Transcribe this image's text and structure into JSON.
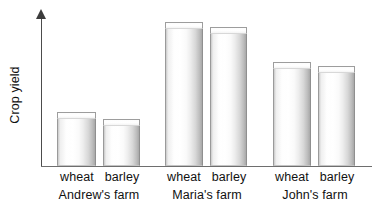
{
  "chart_data": {
    "type": "bar",
    "title": "",
    "subtitle": "",
    "xlabel": "",
    "ylabel": "Crop yield",
    "categories": [
      "Andrew's farm",
      "Maria's farm",
      "John's farm"
    ],
    "subcategories": [
      "wheat",
      "barley"
    ],
    "grid": false,
    "legend_position": "none",
    "y_axis_ticks": [],
    "y_axis_has_arrow": true,
    "y_axis_units": "unlabelled (relative scale)",
    "ylim": [
      0,
      100
    ],
    "series": [
      {
        "name": "wheat",
        "values": [
          37.5,
          100.0,
          72.2
        ]
      },
      {
        "name": "barley",
        "values": [
          32.6,
          96.5,
          69.4
        ]
      }
    ],
    "bars": [
      {
        "group": "Andrew's farm",
        "crop": "wheat",
        "value": 37.5
      },
      {
        "group": "Andrew's farm",
        "crop": "barley",
        "value": 32.6
      },
      {
        "group": "Maria's farm",
        "crop": "wheat",
        "value": 100.0
      },
      {
        "group": "Maria's farm",
        "crop": "barley",
        "value": 96.5
      },
      {
        "group": "John's farm",
        "crop": "wheat",
        "value": 72.2
      },
      {
        "group": "John's farm",
        "crop": "barley",
        "value": 69.4
      }
    ],
    "annotations": []
  },
  "axis": {
    "y_label": "Crop yield"
  },
  "crop_labels": [
    {
      "text": "wheat",
      "left": 57,
      "width": 40
    },
    {
      "text": "barley",
      "left": 102,
      "width": 40
    },
    {
      "text": "wheat",
      "left": 164,
      "width": 40
    },
    {
      "text": "barley",
      "left": 209,
      "width": 40
    },
    {
      "text": "wheat",
      "left": 272,
      "width": 40
    },
    {
      "text": "barley",
      "left": 317,
      "width": 40
    }
  ],
  "group_labels": [
    {
      "text": "Andrew's farm",
      "left": 44,
      "width": 110
    },
    {
      "text": "Maria's farm",
      "left": 152,
      "width": 110
    },
    {
      "text": "John's farm",
      "left": 260,
      "width": 110
    }
  ],
  "bar_geometry": [
    {
      "left": 57,
      "width": 39,
      "height": 54,
      "name": "bar-andrew-wheat"
    },
    {
      "left": 103,
      "width": 37,
      "height": 47,
      "name": "bar-andrew-barley"
    },
    {
      "left": 165,
      "width": 38,
      "height": 144,
      "name": "bar-maria-wheat"
    },
    {
      "left": 210,
      "width": 37,
      "height": 139,
      "name": "bar-maria-barley"
    },
    {
      "left": 273,
      "width": 38,
      "height": 104,
      "name": "bar-john-wheat"
    },
    {
      "left": 318,
      "width": 37,
      "height": 100,
      "name": "bar-john-barley"
    }
  ],
  "colors": {
    "axis": "#4c4c4c",
    "x_axis": "#6e6e6e",
    "bar_fill_light": "#ffffff",
    "bar_fill_shadow": "#a8a8a8",
    "bar_outline": "#9a9a9a",
    "text": "#111111",
    "background": "#ffffff"
  }
}
